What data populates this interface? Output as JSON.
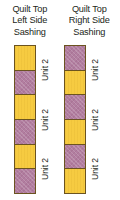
{
  "figure": {
    "background_color": "#ffffff",
    "panels": [
      {
        "id": "left",
        "title": "Quilt Top\nLeft Side\nSashing",
        "strip": {
          "blocks": [
            {
              "fabric": "yellow"
            },
            {
              "fabric": "purple"
            },
            {
              "fabric": "yellow"
            },
            {
              "fabric": "purple"
            },
            {
              "fabric": "yellow"
            },
            {
              "fabric": "purple"
            }
          ],
          "unit_labels": [
            "Unit 2",
            "Unit 2",
            "Unit 2"
          ]
        }
      },
      {
        "id": "right",
        "title": "Quilt Top\nRight Side\nSashing",
        "strip": {
          "blocks": [
            {
              "fabric": "purple"
            },
            {
              "fabric": "yellow"
            },
            {
              "fabric": "purple"
            },
            {
              "fabric": "yellow"
            },
            {
              "fabric": "purple"
            },
            {
              "fabric": "yellow"
            }
          ],
          "unit_labels": [
            "Unit 2",
            "Unit 2",
            "Unit 2"
          ]
        }
      }
    ],
    "colors": {
      "yellow_fabric": "#f6cb41",
      "purple_fabric": "#b27ea0",
      "outline": "#6b5320",
      "text": "#231f20"
    }
  }
}
